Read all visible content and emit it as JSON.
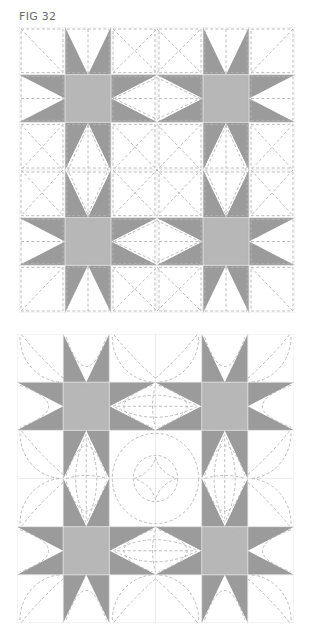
{
  "figure": {
    "label": "FIG 32"
  },
  "diagrams": [
    {
      "id": "fig1",
      "description": "Star quilt block layout with straight-line dashed quilting",
      "grid": {
        "cols": 6,
        "rows": 6
      },
      "star_centers": [
        [
          1,
          1
        ],
        [
          4,
          1
        ],
        [
          1,
          4
        ],
        [
          4,
          4
        ]
      ],
      "quilting": "straight"
    },
    {
      "id": "fig2",
      "description": "Star quilt block layout with curved dashed quilting",
      "grid": {
        "cols": 6,
        "rows": 6
      },
      "star_centers": [
        [
          1,
          1
        ],
        [
          4,
          1
        ],
        [
          1,
          4
        ],
        [
          4,
          4
        ]
      ],
      "quilting": "curved"
    }
  ],
  "colors": {
    "star_points": "#9b9b9b",
    "star_center": "#b7b7b7",
    "background": "#ffffff",
    "quilting_lines": "#b4b4b4"
  }
}
